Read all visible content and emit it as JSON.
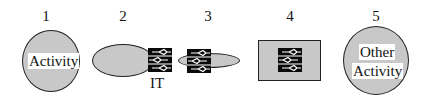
{
  "diagram": {
    "items": [
      {
        "number": "1",
        "shape": "circle",
        "label": "Activity"
      },
      {
        "number": "2",
        "shape": "ellipse-with-it-attached-right",
        "caption": "IT"
      },
      {
        "number": "3",
        "shape": "it-overlapping-ellipse"
      },
      {
        "number": "4",
        "shape": "rectangle-containing-it"
      },
      {
        "number": "5",
        "shape": "circle",
        "label_line1": "Other",
        "label_line2": "Activity"
      }
    ],
    "icon": "it-chip-icon",
    "colors": {
      "fill": "#c8c8c8",
      "stroke": "#222222",
      "chip": "#0a0a0a"
    }
  }
}
